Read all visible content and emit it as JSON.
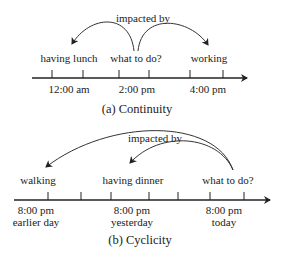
{
  "panel_a": {
    "annotation": "impacted by",
    "events": [
      "having lunch",
      "what to do?",
      "working"
    ],
    "times": [
      "12:00 am",
      "2:00 pm",
      "4:00 pm"
    ],
    "caption": "(a) Continuity"
  },
  "panel_b": {
    "annotation": "impacted by",
    "events": [
      "walking",
      "having dinner",
      "what to do?"
    ],
    "times": [
      "8:00 pm",
      "8:00 pm",
      "8:00 pm"
    ],
    "days": [
      "earlier day",
      "yesterday",
      "today"
    ],
    "caption": "(b) Cyclicity"
  }
}
